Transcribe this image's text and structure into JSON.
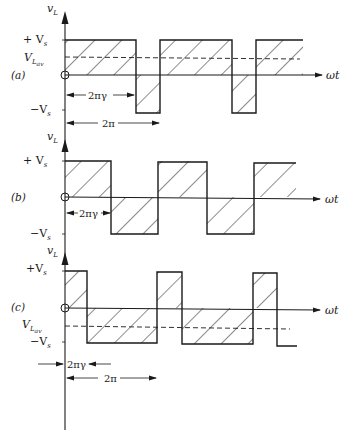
{
  "figure": {
    "colors": {
      "ink": "#1a1a1a",
      "background": "#ffffff"
    },
    "panels": [
      {
        "label": "(a)",
        "y_axis_label": "v_L",
        "x_axis_label": "ωt",
        "levels": {
          "top": "+ V_s",
          "average": "V_L av",
          "bottom": "−V_s"
        },
        "dimensions": {
          "on_time": "2πγ",
          "period": "2π"
        },
        "duty_note": "γ > 0.5, positive average"
      },
      {
        "label": "(b)",
        "y_axis_label": "v_L",
        "x_axis_label": "ωt",
        "levels": {
          "top": "+ V_s",
          "bottom": "−V_s"
        },
        "dimensions": {
          "on_time": "2πγ"
        },
        "duty_note": "γ = 0.5, zero average"
      },
      {
        "label": "(c)",
        "y_axis_label": "v_L",
        "x_axis_label": "ωt",
        "levels": {
          "top": "+V_s",
          "average": "V_L av",
          "bottom": "−V_s"
        },
        "dimensions": {
          "on_time": "2πγ",
          "period": "2π"
        },
        "duty_note": "γ < 0.5, negative average"
      }
    ]
  },
  "text": {
    "a_label": "(a)",
    "b_label": "(b)",
    "c_label": "(c)",
    "vL": "v",
    "vL_sub": "L",
    "plusVs": "+ V",
    "plusVs_c": "+V",
    "Vs_sub": "s",
    "minusVs": "−V",
    "VLav": "V",
    "VLav_sub": "L",
    "VLav_subsub": "av",
    "wt": "ωt",
    "twoPiGamma": "2πγ",
    "twoPi": "2π"
  }
}
